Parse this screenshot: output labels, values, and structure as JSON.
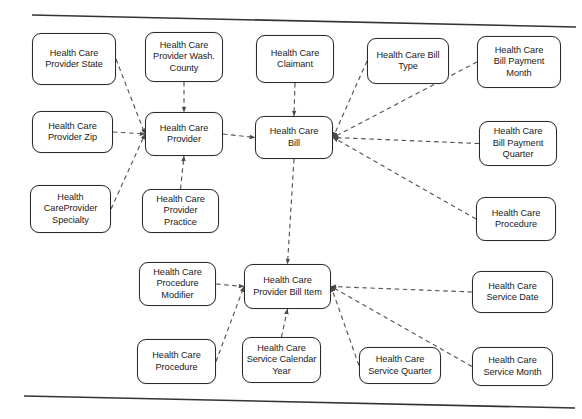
{
  "diagram": {
    "type": "entity-relationship-star-schema",
    "frame": {
      "top_rule": "horizontal-rule-top",
      "bottom_rule": "horizontal-rule-bottom"
    },
    "colors": {
      "node_border": "#2b2b2b",
      "node_fill": "#ffffff",
      "edge": "#555555",
      "text": "#1a1a1a",
      "frame_rule": "#333333"
    },
    "nodes": [
      {
        "id": "provider_state",
        "label": "Health Care\nProvider State",
        "x": 32,
        "y": 33,
        "w": 84,
        "h": 52
      },
      {
        "id": "provider_county",
        "label": "Health Care\nProvider Wash.\nCounty",
        "x": 145,
        "y": 32,
        "w": 78,
        "h": 50
      },
      {
        "id": "claimant",
        "label": "Health Care\nClaimant",
        "x": 256,
        "y": 35,
        "w": 78,
        "h": 48
      },
      {
        "id": "bill_type",
        "label": "Health Care Bill\nType",
        "x": 367,
        "y": 38,
        "w": 82,
        "h": 46
      },
      {
        "id": "bill_payment_month",
        "label": "Health Care\nBill Payment\nMonth",
        "x": 477,
        "y": 36,
        "w": 84,
        "h": 52
      },
      {
        "id": "provider_zip",
        "label": "Health Care\nProvider Zip",
        "x": 32,
        "y": 111,
        "w": 81,
        "h": 42
      },
      {
        "id": "provider",
        "label": "Health Care\nProvider",
        "x": 145,
        "y": 112,
        "w": 78,
        "h": 44
      },
      {
        "id": "bill",
        "label": "Health Care\nBill",
        "x": 255,
        "y": 116,
        "w": 78,
        "h": 43
      },
      {
        "id": "bill_payment_qtr",
        "label": "Health Care\nBill Payment\nQuarter",
        "x": 479,
        "y": 121,
        "w": 78,
        "h": 45
      },
      {
        "id": "provider_specialty",
        "label": "Health\nCareProvider\nSpecialty",
        "x": 30,
        "y": 185,
        "w": 81,
        "h": 48
      },
      {
        "id": "provider_practice",
        "label": "Health Care\nProvider\nPractice",
        "x": 142,
        "y": 189,
        "w": 77,
        "h": 44
      },
      {
        "id": "procedure_right",
        "label": "Health Care\nProcedure",
        "x": 476,
        "y": 197,
        "w": 80,
        "h": 44
      },
      {
        "id": "procedure_modifier",
        "label": "Health Care\nProcedure\nModifier",
        "x": 139,
        "y": 262,
        "w": 77,
        "h": 44
      },
      {
        "id": "provider_bill_item",
        "label": "Health Care\nProvider Bill Item",
        "x": 244,
        "y": 264,
        "w": 87,
        "h": 45
      },
      {
        "id": "service_date",
        "label": "Health Care\nService Date",
        "x": 472,
        "y": 271,
        "w": 81,
        "h": 42
      },
      {
        "id": "procedure_bottom",
        "label": "Health Care\nProcedure",
        "x": 137,
        "y": 339,
        "w": 79,
        "h": 45
      },
      {
        "id": "service_cal_year",
        "label": "Health Care\nService Calendar\nYear",
        "x": 242,
        "y": 337,
        "w": 79,
        "h": 46
      },
      {
        "id": "service_quarter",
        "label": "Health Care\nService Quarter",
        "x": 359,
        "y": 347,
        "w": 82,
        "h": 37
      },
      {
        "id": "service_month",
        "label": "Health Care\nService Month",
        "x": 472,
        "y": 347,
        "w": 81,
        "h": 39
      }
    ],
    "edges": [
      {
        "from": "provider_state",
        "to": "provider",
        "style": "dashed-arrow"
      },
      {
        "from": "provider_county",
        "to": "provider",
        "style": "dashed-arrow"
      },
      {
        "from": "provider_zip",
        "to": "provider",
        "style": "dashed-arrow"
      },
      {
        "from": "provider_specialty",
        "to": "provider",
        "style": "dashed-arrow"
      },
      {
        "from": "provider_practice",
        "to": "provider",
        "style": "dashed-arrow"
      },
      {
        "from": "provider",
        "to": "bill",
        "style": "dashed-arrow"
      },
      {
        "from": "claimant",
        "to": "bill",
        "style": "dashed-arrow"
      },
      {
        "from": "bill_type",
        "to": "bill",
        "style": "dashed-arrow"
      },
      {
        "from": "bill_payment_month",
        "to": "bill",
        "style": "dashed-arrow"
      },
      {
        "from": "bill_payment_qtr",
        "to": "bill",
        "style": "dashed-arrow"
      },
      {
        "from": "procedure_right",
        "to": "bill",
        "style": "dashed-arrow"
      },
      {
        "from": "bill",
        "to": "provider_bill_item",
        "style": "dashed-arrow"
      },
      {
        "from": "procedure_modifier",
        "to": "provider_bill_item",
        "style": "dashed-arrow"
      },
      {
        "from": "procedure_bottom",
        "to": "provider_bill_item",
        "style": "dashed-arrow"
      },
      {
        "from": "service_cal_year",
        "to": "provider_bill_item",
        "style": "dashed-arrow"
      },
      {
        "from": "service_quarter",
        "to": "provider_bill_item",
        "style": "dashed-arrow"
      },
      {
        "from": "service_month",
        "to": "provider_bill_item",
        "style": "dashed-arrow"
      },
      {
        "from": "service_date",
        "to": "provider_bill_item",
        "style": "dashed-arrow"
      }
    ]
  }
}
